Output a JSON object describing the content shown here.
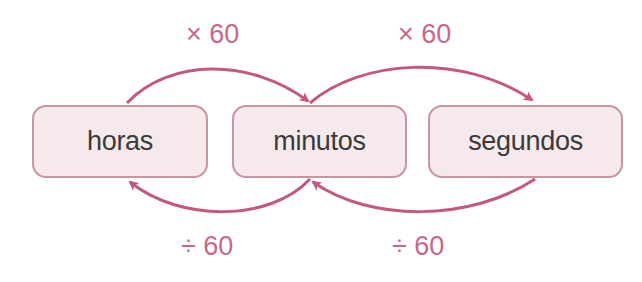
{
  "colors": {
    "arrow": "#c4587f",
    "label": "#c8698a",
    "box_fill": "#f6e9ec",
    "box_border": "#c9959f",
    "box_text": "#3a3a3a"
  },
  "units": [
    {
      "id": "hours",
      "label": "horas"
    },
    {
      "id": "minutes",
      "label": "minutos"
    },
    {
      "id": "seconds",
      "label": "segundos"
    }
  ],
  "conversions": [
    {
      "from": "horas",
      "to": "minutos",
      "label": "× 60",
      "position": "top"
    },
    {
      "from": "minutos",
      "to": "segundos",
      "label": "× 60",
      "position": "top"
    },
    {
      "from": "minutos",
      "to": "horas",
      "label": "÷ 60",
      "position": "bottom"
    },
    {
      "from": "segundos",
      "to": "minutos",
      "label": "÷ 60",
      "position": "bottom"
    }
  ]
}
